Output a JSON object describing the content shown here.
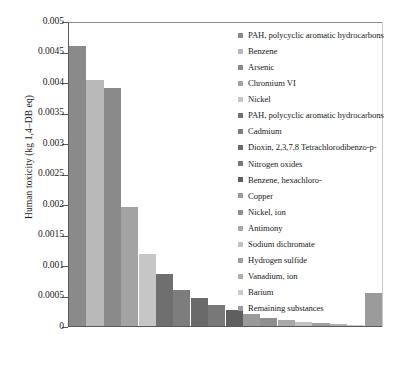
{
  "chart_data": {
    "type": "bar",
    "title": "",
    "xlabel": "",
    "ylabel": "Human toxicity (kg 1,4–DB eq)",
    "ylim": [
      0,
      0.005
    ],
    "ytick_labels": [
      "0.005",
      "0.0045",
      "0.004",
      "0.0035",
      "0.003",
      "0.0025",
      "0.002",
      "0.0015",
      "0.001",
      "0.0005",
      "0"
    ],
    "ytick_values": [
      0.005,
      0.0045,
      0.004,
      0.0035,
      0.003,
      0.0025,
      0.002,
      0.0015,
      0.001,
      0.0005,
      0
    ],
    "grid": false,
    "legend_position": "right",
    "categories": [
      "PAH, polycyclic aromatic hydrocarbons",
      "Benzene",
      "Arsenic",
      "Chromium VI",
      "Nickel",
      "PAH, polycyclic aromatic hydrocarbons",
      "Cadmium",
      "Dioxin, 2,3,7,8 Tetrachlorodibenzo-p-",
      "Nitrogen oxides",
      "Benzene, hexachloro-",
      "Copper",
      "Nickel, ion",
      "Antimony",
      "Sodium dichromate",
      "Hydrogen sulfide",
      "Vanadium, ion",
      "Barium",
      "Remaining substances"
    ],
    "values": [
      0.00461,
      0.00405,
      0.00392,
      0.00196,
      0.00119,
      0.00086,
      0.0006,
      0.00046,
      0.00035,
      0.00026,
      0.00019,
      0.00014,
      0.0001,
      7e-05,
      5e-05,
      3e-05,
      2e-05,
      0.00055
    ],
    "colors": [
      "#8a8a8a",
      "#b9b9b9",
      "#8a8a8a",
      "#a3a3a3",
      "#c6c6c6",
      "#6f6f6f",
      "#7d7d7d",
      "#6a6a6a",
      "#787878",
      "#5f5f5f",
      "#9a9a9a",
      "#8f8f8f",
      "#a8a8a8",
      "#c2c2c2",
      "#9f9f9f",
      "#b0b0b0",
      "#cacaca",
      "#9b9b9b"
    ]
  },
  "legend": {
    "items": [
      {
        "label": "PAH, polycyclic aromatic hydrocarbons",
        "color": "#8a8a8a"
      },
      {
        "label": "Benzene",
        "color": "#b9b9b9"
      },
      {
        "label": "Arsenic",
        "color": "#8a8a8a"
      },
      {
        "label": "Chromium VI",
        "color": "#a3a3a3"
      },
      {
        "label": "Nickel",
        "color": "#c6c6c6"
      },
      {
        "label": "PAH, polycyclic aromatic hydrocarbons",
        "color": "#6f6f6f"
      },
      {
        "label": "Cadmium",
        "color": "#7d7d7d"
      },
      {
        "label": "Dioxin, 2,3,7,8 Tetrachlorodibenzo-p-",
        "color": "#6a6a6a"
      },
      {
        "label": "Nitrogen oxides",
        "color": "#787878"
      },
      {
        "label": "Benzene, hexachloro-",
        "color": "#5f5f5f"
      },
      {
        "label": "Copper",
        "color": "#9a9a9a"
      },
      {
        "label": "Nickel, ion",
        "color": "#8f8f8f"
      },
      {
        "label": "Antimony",
        "color": "#a8a8a8"
      },
      {
        "label": "Sodium dichromate",
        "color": "#c2c2c2"
      },
      {
        "label": "Hydrogen sulfide",
        "color": "#9f9f9f"
      },
      {
        "label": "Vanadium, ion",
        "color": "#b0b0b0"
      },
      {
        "label": "Barium",
        "color": "#cacaca"
      },
      {
        "label": "Remaining substances",
        "color": "#9b9b9b"
      }
    ]
  }
}
